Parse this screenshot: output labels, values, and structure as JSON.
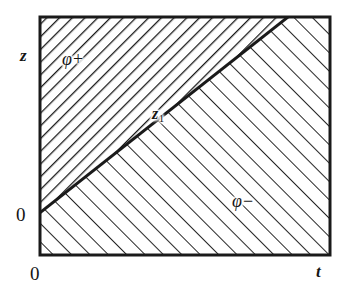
{
  "figure": {
    "kind": "region-diagram",
    "background_color": "#ffffff",
    "ink_color": "#1a1a1a"
  },
  "axes": {
    "x_axis": {
      "name": "t-axis",
      "label": "t",
      "origin_label": "0"
    },
    "y_axis": {
      "name": "z-axis",
      "label": "z",
      "origin_label": "0"
    }
  },
  "labels": {
    "phi_plus": {
      "symbol": "φ",
      "sign": "+",
      "full": "φ+"
    },
    "phi_minus": {
      "symbol": "φ",
      "sign": "−",
      "full": "φ−"
    },
    "z_one": {
      "symbol": "z",
      "subscript": "1",
      "full": "z₁"
    }
  },
  "chart_data": {
    "type": "line",
    "title": "",
    "xlabel": "t",
    "ylabel": "z",
    "xlim": [
      0,
      1
    ],
    "ylim": [
      0,
      1
    ],
    "grid": false,
    "legend": "none",
    "frame": {
      "left_px": 40,
      "top_px": 17,
      "right_px": 330,
      "bottom_px": 255,
      "stroke_width_px": 3
    },
    "series": [
      {
        "name": "boundary-line",
        "kind": "line",
        "x": [
          0,
          0.855
        ],
        "y": [
          0.18,
          1.0
        ],
        "points_px": [
          [
            41,
            212
          ],
          [
            288,
            17
          ]
        ],
        "stroke_width_px": 3
      }
    ],
    "regions": [
      {
        "name": "phi-plus-region",
        "label": "φ+",
        "position": "upper-left",
        "hatch_direction": "backslash",
        "hatch_angle_deg": -45,
        "hatch_spacing_px": 9,
        "hatch_stroke_px": 2.6,
        "polygon_px": [
          [
            40,
            17
          ],
          [
            288,
            17
          ],
          [
            41,
            212
          ]
        ]
      },
      {
        "name": "phi-minus-region",
        "label": "φ−",
        "position": "lower-right",
        "hatch_direction": "slash",
        "hatch_angle_deg": 45,
        "hatch_spacing_px": 13,
        "hatch_stroke_px": 1.9,
        "polygon_px": [
          [
            41,
            212
          ],
          [
            288,
            17
          ],
          [
            330,
            17
          ],
          [
            330,
            255
          ],
          [
            40,
            255
          ]
        ]
      }
    ],
    "annotations": [
      {
        "name": "z1-annotation",
        "text": "z₁",
        "x_px": 160,
        "y_px": 114
      },
      {
        "name": "phi-plus-annotation",
        "text": "φ+",
        "x_px": 76,
        "y_px": 59
      },
      {
        "name": "phi-minus-annotation",
        "text": "φ−",
        "x_px": 246,
        "y_px": 201
      }
    ],
    "tick_labels": {
      "x": [
        "0",
        "t"
      ],
      "y": [
        "0",
        "z"
      ]
    }
  }
}
